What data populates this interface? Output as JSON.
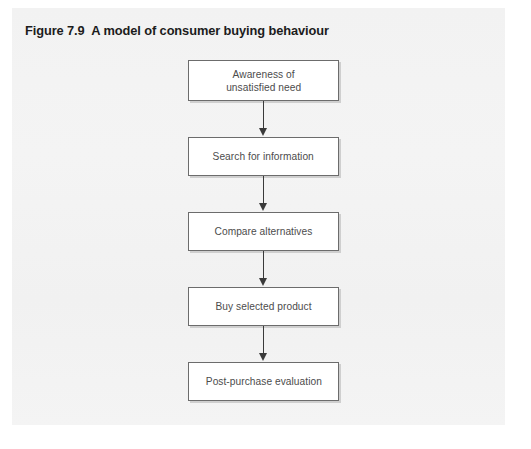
{
  "figure": {
    "number": "Figure 7.9",
    "title": "A model of consumer buying behaviour",
    "panel_color": "#f3f3f3",
    "title_color": "#1c1c1c"
  },
  "diagram": {
    "type": "flowchart",
    "orientation": "vertical-top-to-bottom",
    "node_fill": "#ffffff",
    "node_border_color": "#6c6c6c",
    "node_shadow_color": "#cfcfcf",
    "node_text_color": "#4c4c4c",
    "arrow_color": "#3a3a3a",
    "arrow_label": "flow-arrow-down",
    "nodes": [
      {
        "id": "awareness",
        "label": "Awareness of\nunsatisfied need",
        "line1": "Awareness of",
        "line2": "unsatisfied need",
        "lines": 2
      },
      {
        "id": "search",
        "label": "Search for information",
        "line1": "Search for information",
        "line2": "",
        "lines": 1
      },
      {
        "id": "compare",
        "label": "Compare alternatives",
        "line1": "Compare alternatives",
        "line2": "",
        "lines": 1
      },
      {
        "id": "buy",
        "label": "Buy selected product",
        "line1": "Buy selected product",
        "line2": "",
        "lines": 1
      },
      {
        "id": "evaluate",
        "label": "Post-purchase evaluation",
        "line1": "Post-purchase evaluation",
        "line2": "",
        "lines": 1
      }
    ],
    "edges": [
      {
        "from": "awareness",
        "to": "search"
      },
      {
        "from": "search",
        "to": "compare"
      },
      {
        "from": "compare",
        "to": "buy"
      },
      {
        "from": "buy",
        "to": "evaluate"
      }
    ]
  }
}
